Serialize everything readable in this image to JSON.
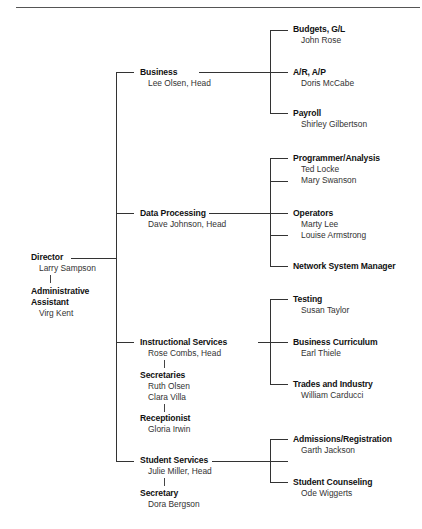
{
  "chart": {
    "director": {
      "title": "Director",
      "person": "Larry Sampson"
    },
    "assistant": {
      "title_line1": "Administrative",
      "title_line2": "Assistant",
      "person": "Virg Kent"
    },
    "departments": [
      {
        "title": "Business",
        "head": "Lee Olsen, Head",
        "units": [
          {
            "title": "Budgets, G/L",
            "people": [
              "John Rose"
            ]
          },
          {
            "title": "A/R, A/P",
            "people": [
              "Doris McCabe"
            ]
          },
          {
            "title": "Payroll",
            "people": [
              "Shirley Gilbertson"
            ]
          }
        ]
      },
      {
        "title": "Data Processing",
        "head": "Dave Johnson, Head",
        "units": [
          {
            "title": "Programmer/Analysis",
            "people": [
              "Ted Locke",
              "Mary Swanson"
            ]
          },
          {
            "title": "Operators",
            "people": [
              "Marty Lee",
              "Louise Armstrong"
            ]
          },
          {
            "title": "Network System Manager",
            "people": []
          }
        ]
      },
      {
        "title": "Instructional Services",
        "head": "Rose Combs, Head",
        "staff": [
          {
            "title": "Secretaries",
            "people": [
              "Ruth Olsen",
              "Clara Villa"
            ]
          },
          {
            "title": "Receptionist",
            "people": [
              "Gloria Irwin"
            ]
          }
        ],
        "units": [
          {
            "title": "Testing",
            "people": [
              "Susan Taylor"
            ]
          },
          {
            "title": "Business Curriculum",
            "people": [
              "Earl Thiele"
            ]
          },
          {
            "title": "Trades and Industry",
            "people": [
              "William Carducci"
            ]
          }
        ]
      },
      {
        "title": "Student Services",
        "head": "Julie Miller, Head",
        "staff": [
          {
            "title": "Secretary",
            "people": [
              "Dora Bergson"
            ]
          }
        ],
        "units": [
          {
            "title": "Admissions/Registration",
            "people": [
              "Garth Jackson"
            ]
          },
          {
            "title": "Student Counseling",
            "people": [
              "Ode Wiggerts"
            ]
          }
        ]
      }
    ]
  }
}
